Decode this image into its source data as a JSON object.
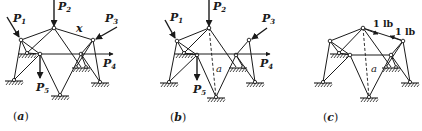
{
  "figure": {
    "panels": [
      {
        "id": "a",
        "caption_open": "(",
        "caption_letter": "a",
        "caption_close": ")",
        "member_label": "x",
        "forces": [
          {
            "name": "P",
            "sub": "1"
          },
          {
            "name": "P",
            "sub": "2"
          },
          {
            "name": "P",
            "sub": "3"
          },
          {
            "name": "P",
            "sub": "4"
          },
          {
            "name": "P",
            "sub": "5"
          }
        ]
      },
      {
        "id": "b",
        "caption_open": "(",
        "caption_letter": "b",
        "caption_close": ")",
        "member_label": "a",
        "forces": [
          {
            "name": "P",
            "sub": "1"
          },
          {
            "name": "P",
            "sub": "2"
          },
          {
            "name": "P",
            "sub": "3"
          },
          {
            "name": "P",
            "sub": "4"
          },
          {
            "name": "P",
            "sub": "5"
          }
        ]
      },
      {
        "id": "c",
        "caption_open": "(",
        "caption_letter": "c",
        "caption_close": ")",
        "member_label": "a",
        "unit_loads": [
          "1 lb",
          "1 lb"
        ]
      }
    ]
  }
}
